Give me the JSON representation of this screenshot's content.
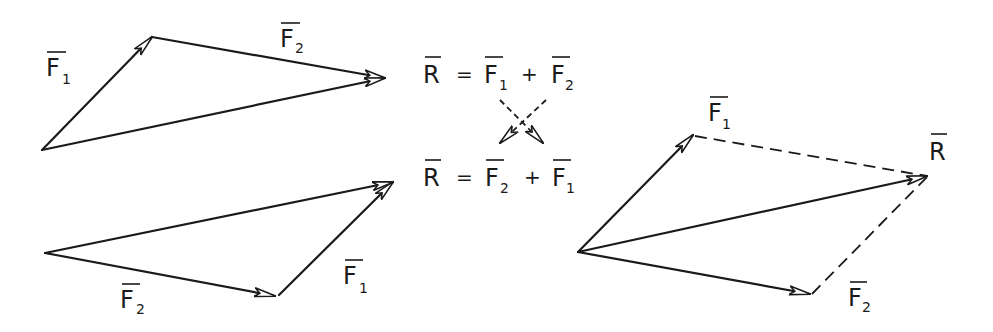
{
  "diagram": {
    "triangle_top": {
      "labels": {
        "first": "F",
        "first_sub": "1",
        "second": "F",
        "second_sub": "2"
      },
      "origin": [
        42,
        150
      ],
      "f1_tip": [
        152,
        37
      ],
      "r_tip": [
        385,
        78
      ]
    },
    "triangle_bottom": {
      "labels": {
        "first": "F",
        "first_sub": "2",
        "second": "F",
        "second_sub": "1"
      },
      "origin": [
        45,
        253
      ],
      "f2_tip": [
        275,
        296
      ],
      "r_tip": [
        393,
        182
      ]
    },
    "equations": [
      {
        "lhs": "R",
        "eq": "=",
        "a": "F",
        "a_sub": "1",
        "plus": "+",
        "b": "F",
        "b_sub": "2"
      },
      {
        "lhs": "R",
        "eq": "=",
        "a": "F",
        "a_sub": "2",
        "plus": "+",
        "b": "F",
        "b_sub": "1"
      }
    ],
    "parallelogram": {
      "labels": {
        "f1": "F",
        "f1_sub": "1",
        "f2": "F",
        "f2_sub": "2",
        "r": "R"
      },
      "origin": [
        578,
        252
      ],
      "f1_tip": [
        693,
        135
      ],
      "r_tip": [
        927,
        176
      ],
      "f2_tip": [
        810,
        294
      ]
    }
  }
}
